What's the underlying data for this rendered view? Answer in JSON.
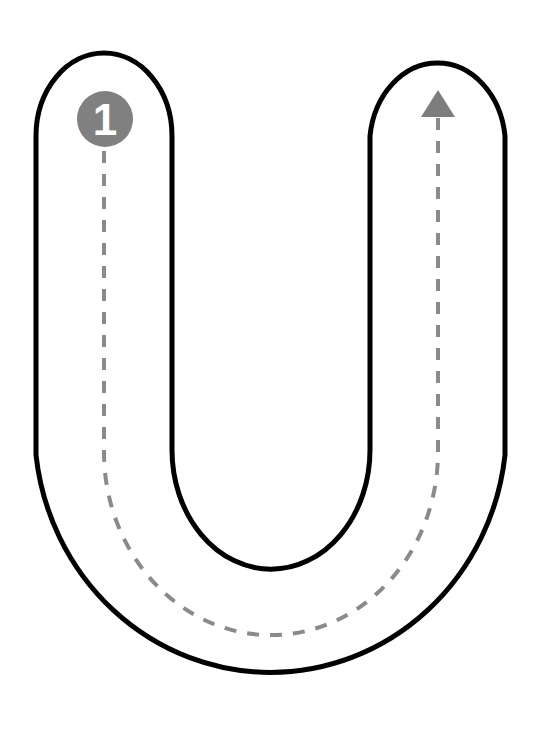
{
  "worksheet": {
    "type": "letter-tracing-worksheet",
    "letter": "U",
    "letter_case": "uppercase",
    "canvas": {
      "width": 541,
      "height": 743
    },
    "background_color": "#ffffff"
  },
  "letter_outline": {
    "name": "letter-u-outline",
    "stroke_color": "#000000",
    "stroke_width": 5,
    "fill_color": "none",
    "description": "Open-topped U shaped outline with rounded caps at both top ends",
    "outer_path": "M 36 136 A 68 83 0 0 1 172 136 L 172 450 A 98 118 0 0 0 370 450 L 370 136 A 68 83 0 0 1 505 136 L 505 455 A 236 245 0 0 1 36 455 Z",
    "geometry": {
      "left_stem_outer_x": 36,
      "left_stem_inner_x": 172,
      "right_stem_inner_x": 370,
      "right_stem_outer_x": 505,
      "top_cap_y": 53,
      "inner_bowl_bottom_y": 567,
      "outer_bowl_bottom_y": 699
    }
  },
  "trace_path": {
    "name": "dashed-guide-path",
    "stroke_color": "#8a8a8a",
    "stroke_width": 4,
    "dash_length": 12,
    "dash_gap": 11,
    "path": "M 104 128 L 104 452 A 166 182 0 0 0 438 452 L 438 110",
    "start_point": {
      "x": 104,
      "y": 128
    },
    "end_point": {
      "x": 438,
      "y": 110
    }
  },
  "start_marker": {
    "name": "step-1-marker",
    "label": "1",
    "circle_fill": "#808080",
    "label_color": "#ffffff",
    "center": {
      "x": 105,
      "y": 119
    },
    "radius": 28
  },
  "direction_arrow": {
    "name": "direction-arrowhead",
    "fill_color": "#7d7d7d",
    "points": "438,90 455,117 421,117",
    "direction": "up",
    "tip": {
      "x": 438,
      "y": 90
    }
  }
}
